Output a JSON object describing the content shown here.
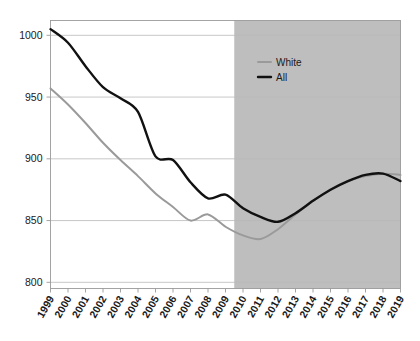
{
  "chart_data": {
    "type": "line",
    "title": "",
    "subtitle": "",
    "xlabel": "",
    "ylabel": "",
    "x": [
      1999,
      2000,
      2001,
      2002,
      2003,
      2004,
      2005,
      2006,
      2007,
      2008,
      2009,
      2010,
      2011,
      2012,
      2013,
      2014,
      2015,
      2016,
      2017,
      2018,
      2019
    ],
    "xtick_labels": [
      "1999",
      "2000",
      "2001",
      "2002",
      "2003",
      "2004",
      "2005",
      "2006",
      "2007",
      "2008",
      "2009",
      "2010",
      "2011",
      "2012",
      "2013",
      "2014",
      "2015",
      "2016",
      "2017",
      "2018",
      "2019"
    ],
    "ytick_labels": [
      "800",
      "850",
      "900",
      "950",
      "1000"
    ],
    "yticks": [
      800,
      850,
      900,
      950,
      1000
    ],
    "ylim": [
      795,
      1012
    ],
    "xlim": [
      1999,
      2019
    ],
    "grid": true,
    "legend_position": "top-right",
    "series": [
      {
        "name": "White",
        "color": "#9a9a9a",
        "width": 2.0,
        "values": [
          957,
          944,
          929,
          913,
          899,
          886,
          872,
          861,
          850,
          855,
          845,
          838,
          835,
          843,
          855,
          866,
          875,
          882,
          886,
          888,
          887
        ]
      },
      {
        "name": "All",
        "color": "#111111",
        "width": 2.4,
        "values": [
          1005,
          994,
          975,
          958,
          949,
          938,
          902,
          899,
          881,
          868,
          871,
          860,
          853,
          849,
          856,
          866,
          875,
          882,
          887,
          888,
          882
        ]
      }
    ],
    "shaded_region": {
      "label": "",
      "x_start": 2009.5,
      "x_end": 2019,
      "color": "#bebebe"
    }
  },
  "legend": {
    "entries": [
      {
        "label": "White",
        "color": "#9a9a9a"
      },
      {
        "label": "All",
        "color": "#111111"
      }
    ]
  }
}
